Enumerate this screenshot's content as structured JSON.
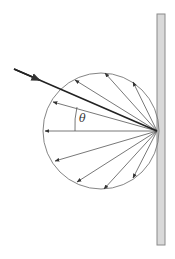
{
  "diagram": {
    "title": "",
    "label_angle": "θ",
    "wall": {
      "x": 157,
      "y": 14,
      "width": 8,
      "height": 231,
      "fill": "#d9d9d9",
      "stroke": "#8a8a8a"
    },
    "incident_ray": {
      "x1": 14,
      "y1": 69,
      "x2": 157,
      "y2": 131,
      "color": "#333333"
    },
    "origin": {
      "x": 157,
      "y": 131
    },
    "circle": {
      "cx": 101,
      "cy": 131,
      "r": 58,
      "color": "#777777"
    },
    "scattered_rays": [
      {
        "x": 53,
        "y": 102
      },
      {
        "x": 75,
        "y": 80
      },
      {
        "x": 105,
        "y": 73
      },
      {
        "x": 133,
        "y": 82
      },
      {
        "x": 45,
        "y": 131
      },
      {
        "x": 55,
        "y": 161
      },
      {
        "x": 77,
        "y": 182
      },
      {
        "x": 104,
        "y": 189
      },
      {
        "x": 133,
        "y": 178
      }
    ]
  }
}
